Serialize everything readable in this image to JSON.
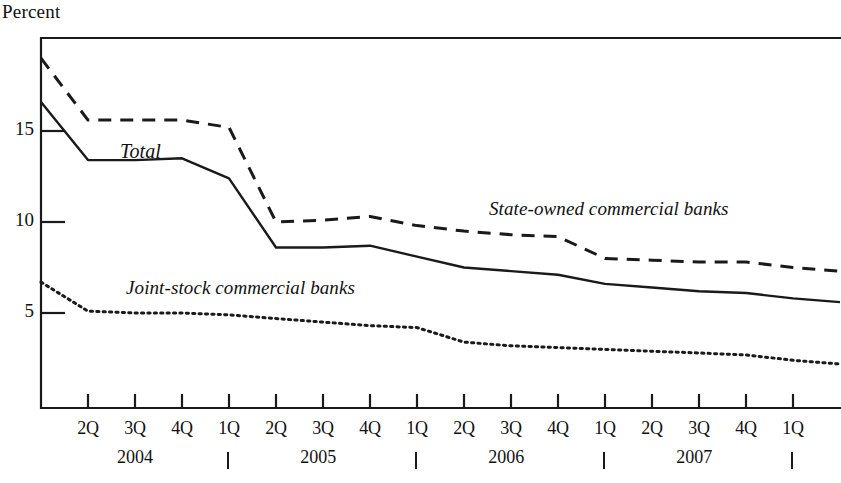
{
  "axis": {
    "y_axis_title": "Percent",
    "y_ticks": [
      {
        "label": "15",
        "value": 15
      },
      {
        "label": "10",
        "value": 10
      },
      {
        "label": "5",
        "value": 5
      }
    ],
    "quarter_labels": [
      "2Q",
      "3Q",
      "4Q",
      "1Q",
      "2Q",
      "3Q",
      "4Q",
      "1Q",
      "2Q",
      "3Q",
      "4Q",
      "1Q",
      "2Q",
      "3Q",
      "4Q",
      "1Q"
    ],
    "year_labels": [
      "2004",
      "2005",
      "2006",
      "2007"
    ]
  },
  "series_labels": {
    "total": "Total",
    "state_owned": "State-owned commercial banks",
    "joint_stock": "Joint-stock commercial banks"
  },
  "chart_data": {
    "type": "line",
    "title": "",
    "xlabel": "",
    "ylabel": "Percent",
    "ylim": [
      0.55,
      20.9
    ],
    "grid": false,
    "legend": "inline-annotations",
    "x": [
      "1Q2004",
      "2Q2004",
      "3Q2004",
      "4Q2004",
      "1Q2005",
      "2Q2005",
      "3Q2005",
      "4Q2005",
      "1Q2006",
      "2Q2006",
      "3Q2006",
      "4Q2006",
      "1Q2007",
      "2Q2007",
      "3Q2007",
      "4Q2007",
      "1Q2008",
      "2Q2008"
    ],
    "categories": [
      "1Q2004",
      "2Q2004",
      "3Q2004",
      "4Q2004",
      "1Q2005",
      "2Q2005",
      "3Q2005",
      "4Q2005",
      "1Q2006",
      "2Q2006",
      "3Q2006",
      "4Q2006",
      "1Q2007",
      "2Q2007",
      "3Q2007",
      "4Q2007",
      "1Q2008",
      "2Q2008"
    ],
    "series": [
      {
        "name": "State-owned commercial banks",
        "style": "dashed",
        "values": [
          19.0,
          15.6,
          15.6,
          15.6,
          15.2,
          10.0,
          10.1,
          10.3,
          9.8,
          9.5,
          9.3,
          9.2,
          8.0,
          7.9,
          7.8,
          7.8,
          7.5,
          7.3
        ]
      },
      {
        "name": "Total",
        "style": "solid",
        "values": [
          16.6,
          13.4,
          13.4,
          13.5,
          12.4,
          8.6,
          8.6,
          8.7,
          8.1,
          7.5,
          7.3,
          7.1,
          6.6,
          6.4,
          6.2,
          6.1,
          5.8,
          5.6
        ]
      },
      {
        "name": "Joint-stock commercial banks",
        "style": "dotted",
        "values": [
          6.7,
          5.1,
          5.0,
          5.0,
          4.9,
          4.7,
          4.5,
          4.3,
          4.2,
          3.4,
          3.2,
          3.1,
          3.0,
          2.9,
          2.8,
          2.7,
          2.4,
          2.2
        ]
      }
    ]
  }
}
